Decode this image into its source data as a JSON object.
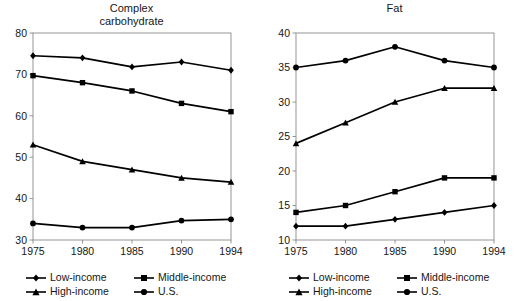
{
  "figure": {
    "background": "#ffffff",
    "line_color": "#000000",
    "axis_color": "#555555"
  },
  "legend": {
    "series": [
      {
        "key": "low",
        "label": "Low-income",
        "marker": "diamond"
      },
      {
        "key": "middle",
        "label": "Middle-income",
        "marker": "square"
      },
      {
        "key": "high",
        "label": "High-income",
        "marker": "triangle"
      },
      {
        "key": "us",
        "label": "U.S.",
        "marker": "circle"
      }
    ]
  },
  "chart_data": [
    {
      "type": "line",
      "title": "Complex\ncarbohydrate",
      "xlabel": "",
      "ylabel": "",
      "grid": false,
      "legend_position": "below",
      "categories": [
        "1975",
        "1980",
        "1985",
        "1990",
        "1994"
      ],
      "ylim": [
        30,
        80
      ],
      "yticks": [
        30,
        40,
        50,
        60,
        70,
        80
      ],
      "series": [
        {
          "name": "Low-income",
          "marker": "diamond",
          "values": [
            74.5,
            74,
            71.8,
            73,
            71
          ]
        },
        {
          "name": "Middle-income",
          "marker": "square",
          "values": [
            69.7,
            68,
            66,
            63,
            61
          ]
        },
        {
          "name": "High-income",
          "marker": "triangle",
          "values": [
            53,
            49,
            47,
            45,
            44
          ]
        },
        {
          "name": "U.S.",
          "marker": "circle",
          "values": [
            34,
            33,
            33,
            34.7,
            35
          ]
        }
      ]
    },
    {
      "type": "line",
      "title": "Fat",
      "xlabel": "",
      "ylabel": "",
      "grid": false,
      "legend_position": "below",
      "categories": [
        "1975",
        "1980",
        "1985",
        "1990",
        "1994"
      ],
      "ylim": [
        10,
        40
      ],
      "yticks": [
        10,
        15,
        20,
        25,
        30,
        35,
        40
      ],
      "series": [
        {
          "name": "U.S.",
          "marker": "circle",
          "values": [
            35,
            36,
            38,
            36,
            35
          ]
        },
        {
          "name": "High-income",
          "marker": "triangle",
          "values": [
            24,
            27,
            30,
            32,
            32
          ]
        },
        {
          "name": "Middle-income",
          "marker": "square",
          "values": [
            14,
            15,
            17,
            19,
            19
          ]
        },
        {
          "name": "Low-income",
          "marker": "diamond",
          "values": [
            12,
            12,
            13,
            14,
            15
          ]
        }
      ]
    }
  ]
}
